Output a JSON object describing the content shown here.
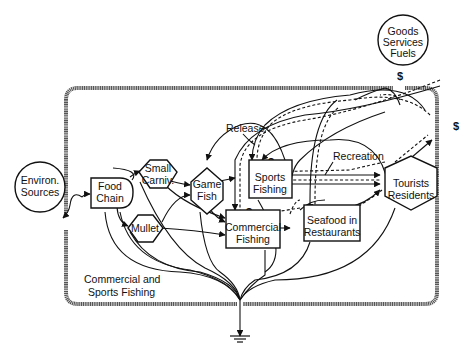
{
  "diagram": {
    "system_label_line1": "Commercial and",
    "system_label_line2": "Sports Fishing",
    "sources": {
      "environ": {
        "line1": "Environ.",
        "line2": "Sources"
      },
      "goods": {
        "line1": "Goods",
        "line2": "Services",
        "line3": "Fuels"
      }
    },
    "nodes": {
      "food_chain": {
        "line1": "Food",
        "line2": "Chain"
      },
      "small_carniv": {
        "line1": "Small",
        "line2": "Carniv."
      },
      "game_fish": {
        "line1": "Game",
        "line2": "Fish"
      },
      "mullet": {
        "line1": "Mullet"
      },
      "sports_fishing": {
        "line1": "Sports",
        "line2": "Fishing"
      },
      "commercial_fishing": {
        "line1": "Commercial",
        "line2": "Fishing"
      },
      "seafood_restaurants": {
        "line1": "Seafood in",
        "line2": "Restaurants"
      },
      "tourists_residents": {
        "line1": "Tourists",
        "line2": "Residents"
      }
    },
    "flow_labels": {
      "release": "Release",
      "recreation": "Recreation"
    },
    "money_symbol": "$"
  }
}
